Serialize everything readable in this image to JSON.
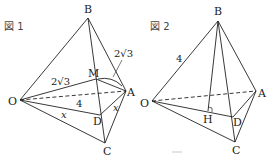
{
  "figures": [
    {
      "title": "図 1",
      "vertices": {
        "B": "B",
        "M": "M",
        "A": "A",
        "O": "O",
        "D": "D",
        "C": "C"
      },
      "edge_labels": {
        "OM": "2√3",
        "MA_arc": "2√3",
        "OA": "4",
        "OD": "x",
        "DA": "x"
      }
    },
    {
      "title": "図 2",
      "vertices": {
        "B": "B",
        "A": "A",
        "O": "O",
        "H": "H",
        "D": "D",
        "C": "C"
      },
      "edge_labels": {
        "OB": "4"
      }
    }
  ],
  "colors": {
    "line": "#222222",
    "background": "#ffffff"
  }
}
